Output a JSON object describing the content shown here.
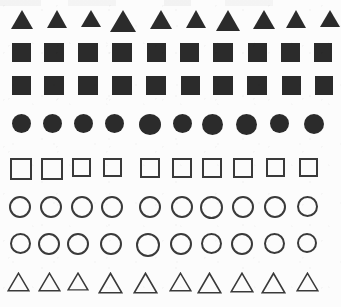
{
  "page": {
    "background_color": "#fcfcfc",
    "filled_color": "#2b2b2b",
    "outline_color": "#3a3a3a",
    "width": 341,
    "height": 307,
    "row_count": 8,
    "column_count": 10,
    "total_shapes": 80
  },
  "rows": [
    {
      "index": 1,
      "shape": "triangle",
      "style": "filled",
      "label": "filled-triangle-row",
      "y": 10,
      "count": 10,
      "cells": [
        {
          "x": 22,
          "w": 22,
          "h": 19
        },
        {
          "x": 57,
          "w": 21,
          "h": 18
        },
        {
          "x": 91,
          "w": 20,
          "h": 17
        },
        {
          "x": 123,
          "w": 26,
          "h": 22
        },
        {
          "x": 161,
          "w": 22,
          "h": 19
        },
        {
          "x": 196,
          "w": 20,
          "h": 18
        },
        {
          "x": 228,
          "w": 24,
          "h": 21
        },
        {
          "x": 264,
          "w": 22,
          "h": 19
        },
        {
          "x": 296,
          "w": 21,
          "h": 18
        },
        {
          "x": 330,
          "w": 20,
          "h": 17
        }
      ]
    },
    {
      "index": 2,
      "shape": "square",
      "style": "filled",
      "label": "filled-square-row-upper",
      "y": 43,
      "count": 10,
      "cells": [
        {
          "x": 21,
          "w": 19,
          "h": 19
        },
        {
          "x": 54,
          "w": 20,
          "h": 19
        },
        {
          "x": 88,
          "w": 20,
          "h": 19
        },
        {
          "x": 122,
          "w": 20,
          "h": 19
        },
        {
          "x": 156,
          "w": 19,
          "h": 19
        },
        {
          "x": 189,
          "w": 19,
          "h": 19
        },
        {
          "x": 223,
          "w": 20,
          "h": 19
        },
        {
          "x": 257,
          "w": 19,
          "h": 19
        },
        {
          "x": 290,
          "w": 19,
          "h": 19
        },
        {
          "x": 323,
          "w": 18,
          "h": 19
        }
      ]
    },
    {
      "index": 3,
      "shape": "square",
      "style": "filled",
      "label": "filled-square-row-lower",
      "y": 76,
      "count": 10,
      "cells": [
        {
          "x": 21,
          "w": 19,
          "h": 19
        },
        {
          "x": 54,
          "w": 20,
          "h": 19
        },
        {
          "x": 88,
          "w": 20,
          "h": 19
        },
        {
          "x": 122,
          "w": 20,
          "h": 19
        },
        {
          "x": 156,
          "w": 20,
          "h": 19
        },
        {
          "x": 190,
          "w": 19,
          "h": 19
        },
        {
          "x": 223,
          "w": 20,
          "h": 19
        },
        {
          "x": 257,
          "w": 20,
          "h": 19
        },
        {
          "x": 291,
          "w": 19,
          "h": 19
        },
        {
          "x": 324,
          "w": 18,
          "h": 19
        }
      ]
    },
    {
      "index": 4,
      "shape": "circle",
      "style": "filled",
      "label": "filled-circle-row",
      "y": 114,
      "count": 10,
      "cells": [
        {
          "x": 21,
          "w": 19,
          "h": 19
        },
        {
          "x": 52,
          "w": 19,
          "h": 19
        },
        {
          "x": 83,
          "w": 19,
          "h": 19
        },
        {
          "x": 114,
          "w": 19,
          "h": 19
        },
        {
          "x": 150,
          "w": 22,
          "h": 21
        },
        {
          "x": 182,
          "w": 19,
          "h": 19
        },
        {
          "x": 212,
          "w": 21,
          "h": 21
        },
        {
          "x": 246,
          "w": 21,
          "h": 21
        },
        {
          "x": 279,
          "w": 19,
          "h": 19
        },
        {
          "x": 314,
          "w": 20,
          "h": 20
        }
      ]
    },
    {
      "index": 5,
      "shape": "square",
      "style": "outlined",
      "label": "outlined-square-row",
      "y": 158,
      "count": 10,
      "cells": [
        {
          "x": 21,
          "w": 22,
          "h": 22
        },
        {
          "x": 52,
          "w": 22,
          "h": 22
        },
        {
          "x": 81,
          "w": 19,
          "h": 19
        },
        {
          "x": 112,
          "w": 19,
          "h": 19
        },
        {
          "x": 150,
          "w": 20,
          "h": 20
        },
        {
          "x": 182,
          "w": 20,
          "h": 20
        },
        {
          "x": 212,
          "w": 20,
          "h": 20
        },
        {
          "x": 243,
          "w": 20,
          "h": 20
        },
        {
          "x": 275,
          "w": 19,
          "h": 19
        },
        {
          "x": 308,
          "w": 19,
          "h": 19
        }
      ]
    },
    {
      "index": 6,
      "shape": "circle",
      "style": "outlined",
      "label": "outlined-circle-row-upper",
      "y": 196,
      "count": 10,
      "cells": [
        {
          "x": 20,
          "w": 22,
          "h": 22
        },
        {
          "x": 51,
          "w": 22,
          "h": 22
        },
        {
          "x": 82,
          "w": 22,
          "h": 22
        },
        {
          "x": 112,
          "w": 22,
          "h": 22
        },
        {
          "x": 150,
          "w": 22,
          "h": 22
        },
        {
          "x": 182,
          "w": 22,
          "h": 22
        },
        {
          "x": 211,
          "w": 23,
          "h": 23
        },
        {
          "x": 243,
          "w": 22,
          "h": 22
        },
        {
          "x": 275,
          "w": 22,
          "h": 22
        },
        {
          "x": 307,
          "w": 21,
          "h": 21
        }
      ]
    },
    {
      "index": 7,
      "shape": "circle",
      "style": "outlined",
      "label": "outlined-circle-row-lower",
      "y": 233,
      "count": 10,
      "cells": [
        {
          "x": 20,
          "w": 21,
          "h": 21
        },
        {
          "x": 49,
          "w": 22,
          "h": 22
        },
        {
          "x": 78,
          "w": 22,
          "h": 22
        },
        {
          "x": 111,
          "w": 22,
          "h": 22
        },
        {
          "x": 148,
          "w": 24,
          "h": 24
        },
        {
          "x": 181,
          "w": 22,
          "h": 22
        },
        {
          "x": 211,
          "w": 21,
          "h": 21
        },
        {
          "x": 242,
          "w": 22,
          "h": 22
        },
        {
          "x": 274,
          "w": 21,
          "h": 21
        },
        {
          "x": 307,
          "w": 20,
          "h": 20
        }
      ]
    },
    {
      "index": 8,
      "shape": "triangle",
      "style": "outlined",
      "label": "outlined-triangle-row",
      "y": 272,
      "count": 10,
      "cells": [
        {
          "x": 18,
          "w": 23,
          "h": 20
        },
        {
          "x": 49,
          "w": 23,
          "h": 20
        },
        {
          "x": 78,
          "w": 22,
          "h": 19
        },
        {
          "x": 110,
          "w": 25,
          "h": 22
        },
        {
          "x": 145,
          "w": 25,
          "h": 22
        },
        {
          "x": 180,
          "w": 23,
          "h": 20
        },
        {
          "x": 209,
          "w": 25,
          "h": 22
        },
        {
          "x": 242,
          "w": 24,
          "h": 21
        },
        {
          "x": 273,
          "w": 25,
          "h": 22
        },
        {
          "x": 307,
          "w": 23,
          "h": 20
        }
      ]
    }
  ]
}
